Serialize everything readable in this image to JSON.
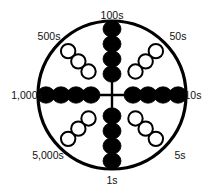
{
  "figure": {
    "type": "circular-abacus-diagram",
    "background_color": "#ffffff",
    "stroke_color": "#000000",
    "text_color": "#111111",
    "circle": {
      "cx": 112,
      "cy": 95,
      "r": 74,
      "stroke_width": 3.2
    }
  },
  "chart_data": {
    "type": "diagram",
    "title": "",
    "subtitle": "",
    "legend": [
      {
        "name": "filled-bead",
        "label": "filled bead",
        "fill": "#000000"
      },
      {
        "name": "hollow-bead",
        "label": "hollow bead",
        "fill": "#ffffff"
      }
    ],
    "spokes": [
      {
        "id": "top",
        "label": "100s",
        "value": 100,
        "bead_style": "filled",
        "bead_count": 4,
        "angle_deg": 270,
        "label_x": 112,
        "label_y": 19,
        "label_anchor": "middle"
      },
      {
        "id": "upper-right",
        "label": "50s",
        "value": 50,
        "bead_style": "hollow",
        "bead_count": 3,
        "angle_deg": 315,
        "label_x": 178,
        "label_y": 40,
        "label_anchor": "middle"
      },
      {
        "id": "right",
        "label": "10s",
        "value": 10,
        "bead_style": "filled",
        "bead_count": 4,
        "angle_deg": 0,
        "label_x": 193,
        "label_y": 99,
        "label_anchor": "middle"
      },
      {
        "id": "lower-right",
        "label": "5s",
        "value": 5,
        "bead_style": "hollow",
        "bead_count": 3,
        "angle_deg": 45,
        "label_x": 180,
        "label_y": 159,
        "label_anchor": "middle"
      },
      {
        "id": "bottom",
        "label": "1s",
        "value": 1,
        "bead_style": "filled",
        "bead_count": 4,
        "angle_deg": 90,
        "label_x": 112,
        "label_y": 184,
        "label_anchor": "middle"
      },
      {
        "id": "lower-left",
        "label": "5,000s",
        "value": 5000,
        "bead_style": "hollow",
        "bead_count": 3,
        "angle_deg": 135,
        "label_x": 48,
        "label_y": 159,
        "label_anchor": "middle"
      },
      {
        "id": "left",
        "label": "1,000s",
        "value": 1000,
        "bead_style": "filled",
        "bead_count": 4,
        "angle_deg": 180,
        "label_x": 27,
        "label_y": 99,
        "label_anchor": "middle"
      },
      {
        "id": "upper-left",
        "label": "500s",
        "value": 500,
        "bead_style": "hollow",
        "bead_count": 3,
        "angle_deg": 225,
        "label_x": 49,
        "label_y": 40,
        "label_anchor": "middle"
      }
    ]
  }
}
